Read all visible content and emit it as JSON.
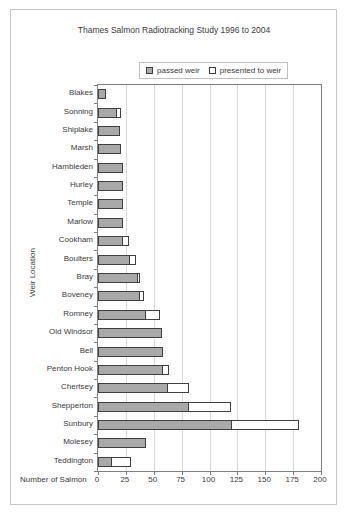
{
  "title": "Thames Salmon Radiotracking Study 1996 to 2004",
  "legend": {
    "passed_label": "passed weir",
    "presented_label": "presented to weir"
  },
  "axes": {
    "x_label": "Number of Salmon",
    "y_label": "Weir Location",
    "x_ticks": [
      0,
      25,
      50,
      75,
      100,
      125,
      150,
      175,
      200
    ]
  },
  "colors": {
    "passed_fill": "#a9a9a9",
    "presented_fill": "#ffffff",
    "bar_border": "#3f3f3f",
    "grid": "#d8d8d8",
    "plot_border": "#808080",
    "outer_border": "#c8c8c8",
    "text": "#3a3a3a"
  },
  "chart_data": {
    "type": "bar",
    "orientation": "horizontal",
    "stacked": true,
    "title": "Thames Salmon Radiotracking Study 1996 to 2004",
    "xlabel": "Number of Salmon",
    "ylabel": "Weir Location",
    "xlim": [
      0,
      200
    ],
    "grid": true,
    "legend_position": "top",
    "categories": [
      "Blakes",
      "Sonning",
      "Shiplake",
      "Marsh",
      "Hambleden",
      "Hurley",
      "Temple",
      "Marlow",
      "Cookham",
      "Boulters",
      "Bray",
      "Boveney",
      "Romney",
      "Old Windsor",
      "Bell",
      "Penton Hook",
      "Chertsey",
      "Shepperton",
      "Sunbury",
      "Molesey",
      "Teddington"
    ],
    "series": [
      {
        "name": "passed weir",
        "values": [
          7,
          17,
          20,
          21,
          22,
          22,
          22,
          22,
          22,
          29,
          36,
          38,
          43,
          57,
          58,
          58,
          63,
          82,
          120,
          43,
          13
        ]
      },
      {
        "name": "presented to weir",
        "values": [
          0,
          4,
          0,
          0,
          0,
          0,
          0,
          0,
          5,
          5,
          2,
          4,
          13,
          0,
          0,
          5,
          19,
          38,
          60,
          0,
          17
        ]
      }
    ],
    "totals": [
      7,
      21,
      20,
      21,
      22,
      22,
      22,
      22,
      27,
      34,
      38,
      42,
      56,
      57,
      58,
      63,
      82,
      120,
      180,
      43,
      30
    ]
  }
}
